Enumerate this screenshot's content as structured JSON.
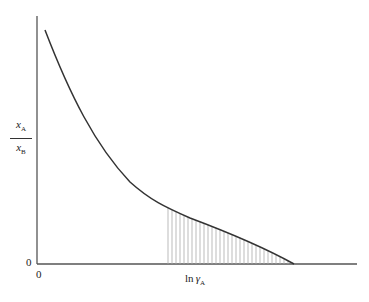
{
  "diagram": {
    "y_axis_label": {
      "numerator": "x",
      "numerator_sub": "A",
      "denominator": "x",
      "denominator_sub": "B"
    },
    "x_axis_label": {
      "prefix": "ln",
      "symbol": "γ",
      "sub": "A"
    },
    "y_origin_label": "0",
    "x_origin_label": "0",
    "colors": {
      "curve": "#333333",
      "axis": "#555555",
      "hatch": "#aaaaaa"
    }
  }
}
